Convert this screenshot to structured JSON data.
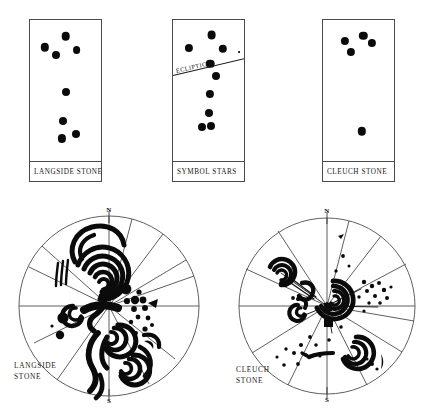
{
  "figure": {
    "background_color": "#ffffff",
    "ink_color": "#0b0b0b"
  },
  "panels": [
    {
      "id": "langside-stone-panel",
      "caption": "LANGSIDE STONE",
      "box": {
        "x": 29,
        "y": 19,
        "w": 73,
        "h": 163
      },
      "stars": [
        {
          "x": 0.5,
          "y": 0.115,
          "r": 4.3
        },
        {
          "x": 0.205,
          "y": 0.195,
          "r": 4.2
        },
        {
          "x": 0.365,
          "y": 0.245,
          "r": 4.0
        },
        {
          "x": 0.655,
          "y": 0.215,
          "r": 3.9
        },
        {
          "x": 0.505,
          "y": 0.51,
          "r": 4.0
        },
        {
          "x": 0.465,
          "y": 0.715,
          "r": 4.0
        },
        {
          "x": 0.445,
          "y": 0.84,
          "r": 4.1
        },
        {
          "x": 0.645,
          "y": 0.805,
          "r": 4.0
        }
      ]
    },
    {
      "id": "symbol-stars-panel",
      "caption": "SYMBOL STARS",
      "box": {
        "x": 172,
        "y": 19,
        "w": 73,
        "h": 163
      },
      "stars": [
        {
          "x": 0.545,
          "y": 0.105,
          "r": 4.4
        },
        {
          "x": 0.225,
          "y": 0.2,
          "r": 4.1
        },
        {
          "x": 0.7,
          "y": 0.205,
          "r": 4.2
        },
        {
          "x": 0.52,
          "y": 0.31,
          "r": 4.3
        },
        {
          "x": 0.61,
          "y": 0.4,
          "r": 4.0
        },
        {
          "x": 0.52,
          "y": 0.525,
          "r": 4.1
        },
        {
          "x": 0.51,
          "y": 0.66,
          "r": 4.0
        },
        {
          "x": 0.415,
          "y": 0.76,
          "r": 4.0
        },
        {
          "x": 0.53,
          "y": 0.755,
          "r": 4.0
        }
      ],
      "ecliptic": {
        "label": "ECLIPTIC",
        "x1": 0.005,
        "y1": 0.385,
        "x2": 1.015,
        "y2": 0.168,
        "tick": {
          "x": 0.905,
          "y": 0.225,
          "r": 0.9
        }
      }
    },
    {
      "id": "cleuch-stone-panel",
      "caption": "CLEUCH STONE",
      "box": {
        "x": 322,
        "y": 19,
        "w": 73,
        "h": 163
      },
      "stars": [
        {
          "x": 0.31,
          "y": 0.15,
          "r": 4.1
        },
        {
          "x": 0.565,
          "y": 0.11,
          "r": 4.2
        },
        {
          "x": 0.69,
          "y": 0.165,
          "r": 4.1
        },
        {
          "x": 0.39,
          "y": 0.225,
          "r": 4.1
        },
        {
          "x": 0.545,
          "y": 0.79,
          "r": 4.2
        }
      ]
    }
  ],
  "skycharts": [
    {
      "id": "langside-stone-chart",
      "caption": "LANGSIDE\nSTONE",
      "north_label": "N",
      "south_label": "S",
      "center": {
        "x": 109,
        "y": 306
      },
      "radius": 92,
      "caption_pos": {
        "x": 14,
        "y": 362
      },
      "radial_rays_deg": [
        0,
        18,
        52,
        90,
        128,
        160,
        180,
        200,
        232,
        270,
        300,
        340
      ],
      "motifs": "double-spiral-serpent"
    },
    {
      "id": "cleuch-stone-chart",
      "caption": "CLEUCH\nSTONE",
      "north_label": "N",
      "south_label": "S",
      "center": {
        "x": 327,
        "y": 306
      },
      "radius": 90,
      "caption_pos": {
        "x": 236,
        "y": 366
      },
      "radial_rays_deg": [
        0,
        25,
        55,
        80,
        100,
        140,
        180,
        205,
        240,
        265,
        290,
        320
      ],
      "motifs": "triple-spiral-cluster"
    }
  ]
}
